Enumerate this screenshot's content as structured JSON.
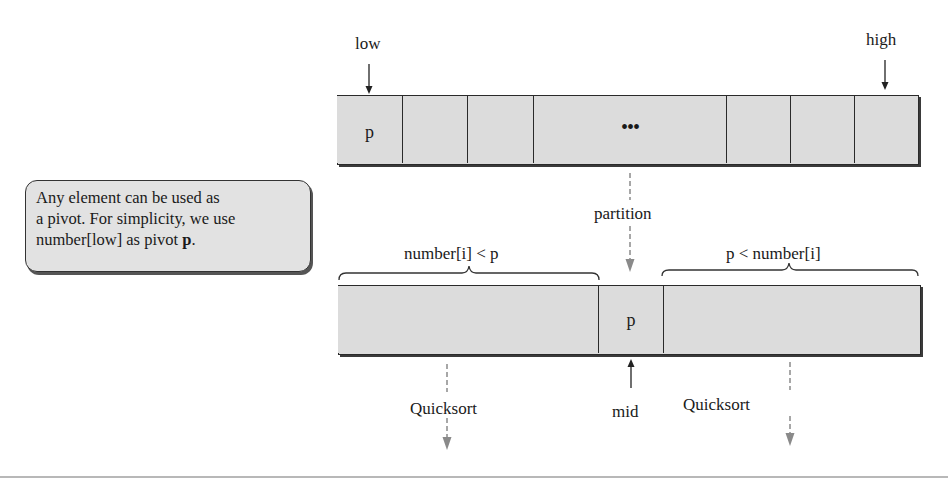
{
  "diagram": {
    "top_array": {
      "low_label": "low",
      "high_label": "high",
      "pivot_cell": "p",
      "ellipsis": "•••",
      "cell_count_left": 3,
      "cell_count_right": 3
    },
    "note": {
      "line1": "Any element can be used as",
      "line2": "a pivot. For simplicity, we use",
      "line3_prefix": "number[low] as pivot ",
      "line3_bold": "p",
      "line3_suffix": "."
    },
    "partition_label": "partition",
    "bottom_array": {
      "left_brace_label": "number[i] < p",
      "right_brace_label": "p < number[i]",
      "pivot_cell": "p",
      "mid_label": "mid"
    },
    "recursion": {
      "left_label": "Quicksort",
      "right_label": "Quicksort"
    },
    "colors": {
      "cell_fill": "#dcdcdc",
      "border": "#2a2a2a",
      "dashed_arrow": "#8a8a8a"
    }
  }
}
